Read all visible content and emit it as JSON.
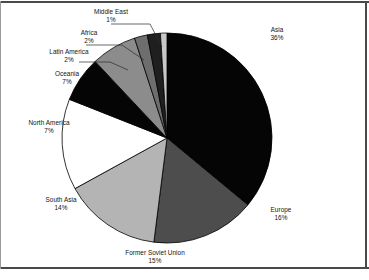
{
  "chart_data": {
    "type": "pie",
    "title": "",
    "subtitle": "",
    "legend_position": "labels-outside",
    "grid": false,
    "start_angle_deg": -90,
    "direction": "clockwise",
    "units": "percent",
    "total": 100,
    "categories": [
      "Asia",
      "Europe",
      "Former Soviet Union",
      "South Asia",
      "North America",
      "Oceania",
      "Latin America",
      "Africa",
      "Middle East"
    ],
    "values": [
      36,
      16,
      15,
      14,
      7,
      7,
      2,
      2,
      1
    ],
    "slices": [
      {
        "label": "Asia",
        "value": 36,
        "pct_text": "36%",
        "color": "#050505",
        "outline": "#000000"
      },
      {
        "label": "Europe",
        "value": 16,
        "pct_text": "16%",
        "color": "#4d4d4d",
        "outline": "#000000"
      },
      {
        "label": "Former Soviet Union",
        "value": 15,
        "pct_text": "15%",
        "color": "#b4b4b4",
        "outline": "#000000"
      },
      {
        "label": "South Asia",
        "value": 14,
        "pct_text": "14%",
        "color": "#ffffff",
        "outline": "#000000"
      },
      {
        "label": "North America",
        "value": 7,
        "pct_text": "7%",
        "color": "#050505",
        "outline": "#000000"
      },
      {
        "label": "Oceania",
        "value": 7,
        "pct_text": "7%",
        "color": "#8c8c8c",
        "outline": "#000000"
      },
      {
        "label": "Latin America",
        "value": 2,
        "pct_text": "2%",
        "color": "#6e6e6e",
        "outline": "#000000"
      },
      {
        "label": "Africa",
        "value": 2,
        "pct_text": "2%",
        "color": "#1f1f1f",
        "outline": "#000000"
      },
      {
        "label": "Middle East",
        "value": 1,
        "pct_text": "1%",
        "color": "#c8c8c8",
        "outline": "#000000"
      }
    ],
    "xlabel": "",
    "ylabel": ""
  },
  "labels": {
    "asia": {
      "name": "Asia",
      "pct": "36%"
    },
    "europe": {
      "name": "Europe",
      "pct": "16%"
    },
    "fsu": {
      "name": "Former Soviet Union",
      "pct": "15%"
    },
    "south_asia": {
      "name": "South Asia",
      "pct": "14%"
    },
    "north_america": {
      "name": "North America",
      "pct": "7%"
    },
    "oceania": {
      "name": "Oceania",
      "pct": "7%"
    },
    "latin_america": {
      "name": "Latin America",
      "pct": "2%"
    },
    "africa": {
      "name": "Africa",
      "pct": "2%"
    },
    "middle_east": {
      "name": "Middle East",
      "pct": "1%"
    }
  },
  "colors": {
    "frame": "#4a4a4a",
    "background": "#ffffff",
    "text": "#121212",
    "leader_line": "#2a2a2a"
  }
}
